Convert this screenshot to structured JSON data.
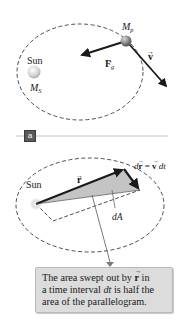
{
  "figure": {
    "part_a": {
      "sun_label": "Sun",
      "sun_mass_label": "M",
      "sun_mass_subscript": "S",
      "planet_mass_label": "M",
      "planet_mass_subscript": "p",
      "force_label": "F",
      "force_subscript": "g",
      "velocity_label": "v",
      "panel_tag": "a"
    },
    "part_b": {
      "sun_label": "Sun",
      "radius_label": "r",
      "displacement_label_left": "d",
      "displacement_vector": "r",
      "equals": " = ",
      "velocity_vector": "v",
      "dt": "dt",
      "area_label": "dA"
    },
    "callout": {
      "line1_pre": "The area swept out by ",
      "line1_vec": "r",
      "line1_post": " in",
      "line2_pre": "a time interval ",
      "line2_italic": "dt",
      "line2_post": " is half the",
      "line3": "area of the parallelogram."
    }
  },
  "colors": {
    "ink": "#1a1a1a",
    "orbit_dash": "#3a3a3a",
    "sweep_fill": "#c4c4c4",
    "callout_bg": "#dcdcdc",
    "planet": "#8a8a8a",
    "sun": "#e6e6e6"
  }
}
